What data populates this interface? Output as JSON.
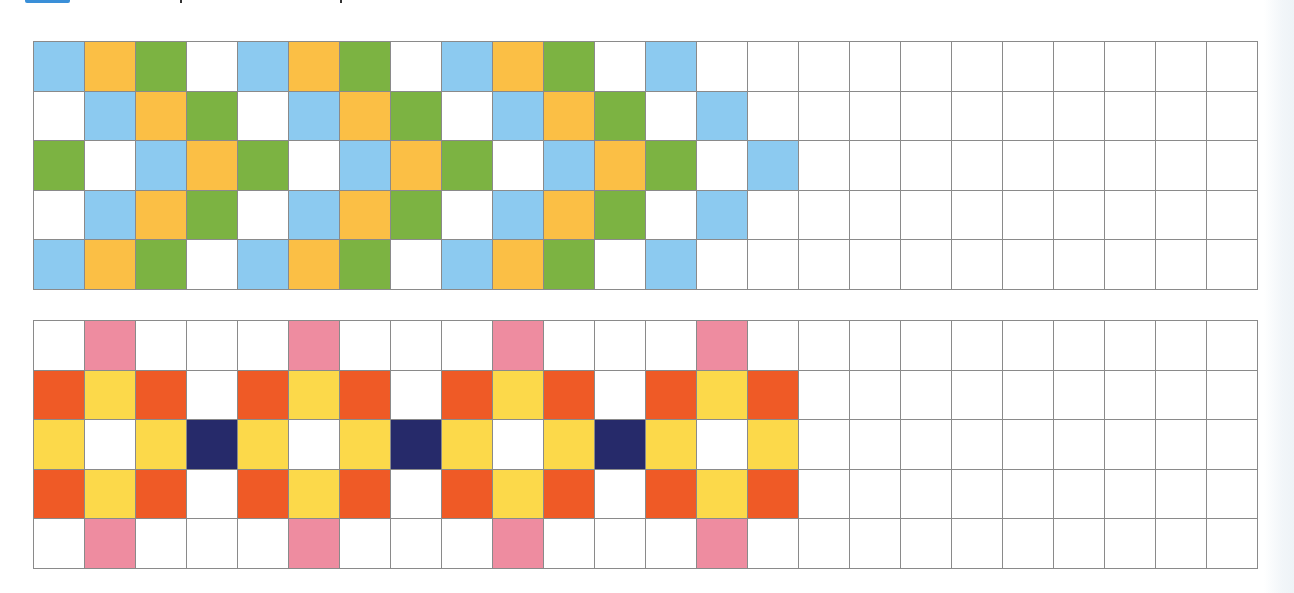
{
  "worksheet": {
    "header": {
      "accent_bar_color": "#3a8fd8",
      "title_visible": false
    },
    "palette": {
      "W": "#ffffff",
      "B": "#8ccaf0",
      "O": "#fbbf45",
      "G": "#7cb342",
      "R": "#ef5a26",
      "Y": "#fcd94a",
      "N": "#262a6a",
      "P": "#ee8ca0"
    },
    "palette_names": {
      "W": "white",
      "B": "light-blue",
      "O": "orange",
      "G": "green",
      "R": "red-orange",
      "Y": "yellow",
      "N": "navy",
      "P": "pink"
    },
    "grid_columns": 24,
    "grids": [
      {
        "id": "top-pattern",
        "rows": [
          "BOGWBOGWBOGWBWWWWWWWWWWW",
          "WBOGWBOGWBOGWBWWWWWWWWWW",
          "GWBOGWBOGWBOGWBWWWWWWWWW",
          "WBOGWBOGWBOGWBWWWWWWWWWW",
          "BOGWBOGWBOGWBWWWWWWWWWWW"
        ]
      },
      {
        "id": "bottom-pattern",
        "rows": [
          "WPWWWPWWWPWWWPWWWWWWWWWW",
          "RYRWRYRWRYRWRYRWWWWWWWWW",
          "YWYNYWYNYWYNYWYWWWWWWWWW",
          "RYRWRYRWRYRWRYRWWWWWWWWW",
          "WPWWWPWWWPWWWPWWWWWWWWWW"
        ]
      }
    ]
  }
}
